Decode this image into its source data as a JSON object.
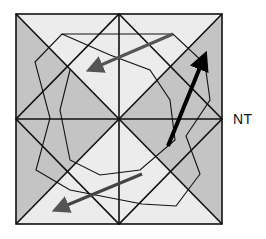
{
  "diagram": {
    "label": "NT",
    "colors": {
      "light": "#ececec",
      "dark": "#c4c4c4",
      "line": "#111111",
      "arrow_gray": "#555555",
      "arrow_black": "#000000"
    }
  }
}
